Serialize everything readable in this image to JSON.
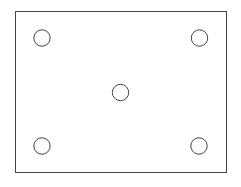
{
  "canvas": {
    "width": 241,
    "height": 187,
    "background_color": "#ffffff",
    "title": "Rectangular plate with five circular holes"
  },
  "style": {
    "stroke_color": "#43434c",
    "stroke_color_light": "#5a5a63",
    "fill_color": "#ffffff",
    "stroke_width": 1
  },
  "chart_data": {
    "type": "scatter",
    "title": "Rectangular plate with five circular holes",
    "xlabel": "",
    "ylabel": "",
    "xlim": [
      0,
      241
    ],
    "ylim": [
      0,
      187
    ],
    "grid": false,
    "legend": false,
    "shapes": [
      {
        "name": "plate-outline",
        "shape": "rectangle",
        "x": 15,
        "y": 11,
        "width": 211,
        "height": 161,
        "fill": "#ffffff",
        "stroke": "#43434c"
      }
    ],
    "series": [
      {
        "name": "holes",
        "marker": "circle-open",
        "radius": 8.2,
        "points": [
          {
            "label": "top-left-hole",
            "x": 42,
            "y": 38
          },
          {
            "label": "top-right-hole",
            "x": 199.5,
            "y": 38
          },
          {
            "label": "center-hole",
            "x": 120.5,
            "y": 92.5
          },
          {
            "label": "bottom-left-hole",
            "x": 42,
            "y": 146
          },
          {
            "label": "bottom-right-hole",
            "x": 199,
            "y": 146
          }
        ]
      }
    ]
  }
}
